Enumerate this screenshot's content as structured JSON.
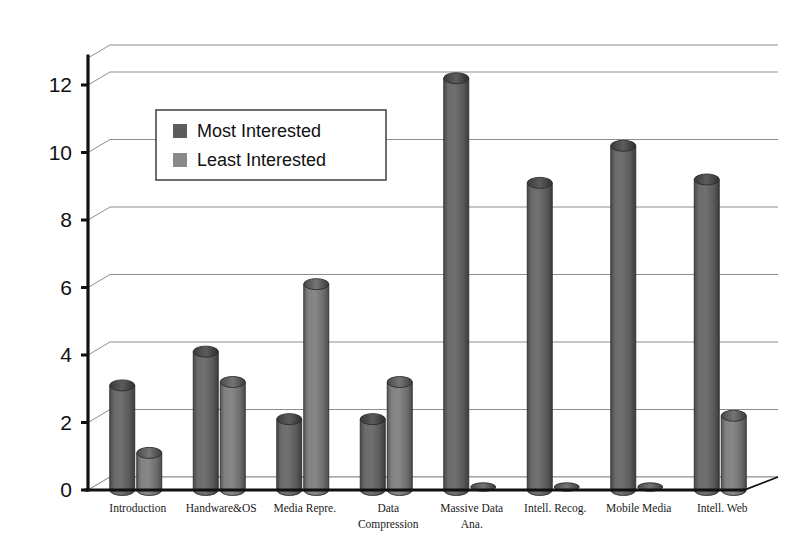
{
  "chart_data": {
    "type": "bar",
    "title": "",
    "subtitle": "",
    "xlabel": "",
    "ylabel": "",
    "ylim": [
      0,
      12.8
    ],
    "yticks": [
      0,
      2,
      4,
      6,
      8,
      10,
      12
    ],
    "ytick_labels": [
      "0",
      "2",
      "4",
      "6",
      "8",
      "10",
      "12"
    ],
    "grid": true,
    "grid_axis": "y",
    "legend_position": "upper-left-inside",
    "style": "3d-cylinder-bars",
    "categories": [
      "Introduction",
      "Handware&OS",
      "Media Repre.",
      "Data Compression",
      "Massive Data Ana.",
      "Intell. Recog.",
      "Mobile Media",
      "Intell. Web"
    ],
    "category_lines": [
      [
        "Introduction"
      ],
      [
        "Handware&OS"
      ],
      [
        "Media Repre."
      ],
      [
        "Data",
        "Compression"
      ],
      [
        "Massive Data",
        "Ana."
      ],
      [
        "Intell. Recog."
      ],
      [
        "Mobile Media"
      ],
      [
        "Intell. Web"
      ]
    ],
    "series": [
      {
        "name": "Most Interested",
        "color": "#5d5d5d",
        "values": [
          3.1,
          4.1,
          2.1,
          2.1,
          12.2,
          9.1,
          10.2,
          9.2
        ]
      },
      {
        "name": "Least Interested",
        "color": "#7b7b7b",
        "values": [
          1.1,
          3.2,
          6.1,
          3.2,
          0.1,
          0.1,
          0.1,
          2.2
        ]
      }
    ]
  },
  "legend": {
    "entries": [
      {
        "label": "Most Interested",
        "swatch_color": "#5d5d5d"
      },
      {
        "label": "Least Interested",
        "swatch_color": "#8a8a8a"
      }
    ]
  },
  "colors": {
    "background": "#ffffff",
    "axis": "#111111",
    "gridline": "#8d8d8d",
    "series_most": "#5d5d5d",
    "series_least": "#7b7b7b",
    "legend_border": "#4a4a4a"
  }
}
